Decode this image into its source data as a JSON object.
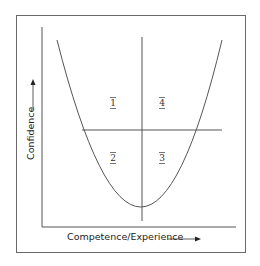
{
  "diagram": {
    "title": "",
    "x_axis_label": "Competence/Experience",
    "y_axis_label": "Confidence",
    "quadrants": [
      {
        "id": "q1",
        "label": "1",
        "position": "upper-left"
      },
      {
        "id": "q4",
        "label": "4",
        "position": "upper-right"
      },
      {
        "id": "q2",
        "label": "2",
        "position": "lower-left"
      },
      {
        "id": "q3",
        "label": "3",
        "position": "lower-right"
      }
    ],
    "curve": "U-shaped (parabola) with minimum at the centre vertical line",
    "colors": {
      "line": "#555555",
      "frame": "#6a6a6a",
      "text": "#222222"
    }
  }
}
